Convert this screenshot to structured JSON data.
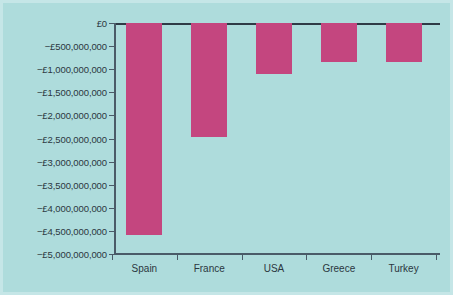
{
  "chart_data": {
    "type": "bar",
    "title": "",
    "subtitle": "",
    "xlabel": "",
    "ylabel": "",
    "categories": [
      "Spain",
      "France",
      "USA",
      "Greece",
      "Turkey"
    ],
    "values": [
      -4580000000,
      -2460000000,
      -1100000000,
      -850000000,
      -850000000
    ],
    "series": [
      {
        "name": "",
        "values": [
          -4580000000,
          -2460000000,
          -1100000000,
          -850000000,
          -850000000
        ]
      }
    ],
    "ylim": [
      -5000000000,
      0
    ],
    "ytick_values": [
      0,
      -500000000,
      -1000000000,
      -1500000000,
      -2000000000,
      -2500000000,
      -3000000000,
      -3500000000,
      -4000000000,
      -4500000000,
      -5000000000
    ],
    "ytick_labels": [
      "£0",
      "−£500,000,000",
      "−£1,000,000,000",
      "−£1,500,000,000",
      "−£2,000,000,000",
      "−£2,500,000,000",
      "−£3,000,000,000",
      "−£3,500,000,000",
      "−£4,000,000,000",
      "−£4,500,000,000",
      "−£5,000,000,000"
    ],
    "grid": false,
    "legend": "none",
    "currency_symbol": "£",
    "colors": {
      "bar": "#c4467f",
      "background": "#aedcdc",
      "axis": "#4a5b68",
      "zero_line": "#2f3b46",
      "text": "#2b3740",
      "border": "#c5e6e7"
    }
  }
}
